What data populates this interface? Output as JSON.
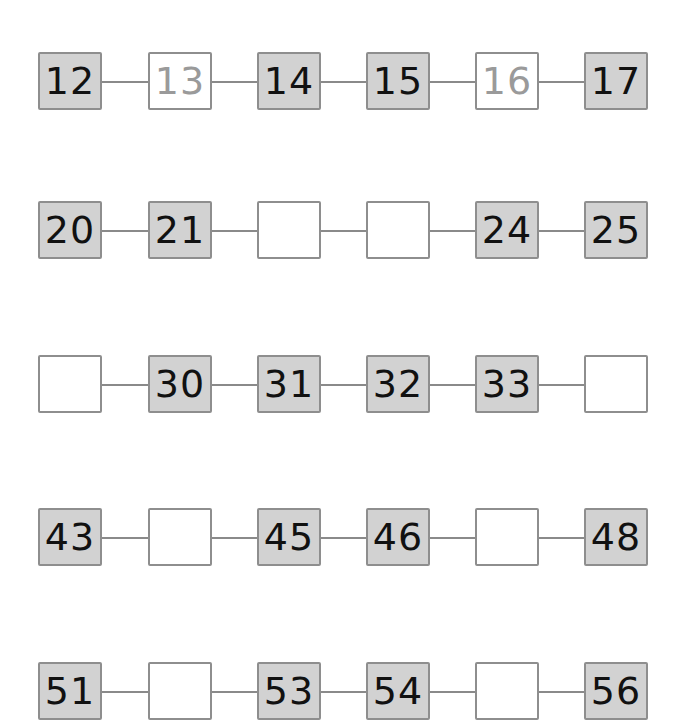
{
  "worksheet": {
    "rows": [
      {
        "cells": [
          {
            "value": "12",
            "state": "given"
          },
          {
            "value": "13",
            "state": "hint"
          },
          {
            "value": "14",
            "state": "given"
          },
          {
            "value": "15",
            "state": "given"
          },
          {
            "value": "16",
            "state": "hint"
          },
          {
            "value": "17",
            "state": "given"
          }
        ]
      },
      {
        "cells": [
          {
            "value": "20",
            "state": "given"
          },
          {
            "value": "21",
            "state": "given"
          },
          {
            "value": "",
            "state": "blank"
          },
          {
            "value": "",
            "state": "blank"
          },
          {
            "value": "24",
            "state": "given"
          },
          {
            "value": "25",
            "state": "given"
          }
        ]
      },
      {
        "cells": [
          {
            "value": "",
            "state": "blank"
          },
          {
            "value": "30",
            "state": "given"
          },
          {
            "value": "31",
            "state": "given"
          },
          {
            "value": "32",
            "state": "given"
          },
          {
            "value": "33",
            "state": "given"
          },
          {
            "value": "",
            "state": "blank"
          }
        ]
      },
      {
        "cells": [
          {
            "value": "43",
            "state": "given"
          },
          {
            "value": "",
            "state": "blank"
          },
          {
            "value": "45",
            "state": "given"
          },
          {
            "value": "46",
            "state": "given"
          },
          {
            "value": "",
            "state": "blank"
          },
          {
            "value": "48",
            "state": "given"
          }
        ]
      },
      {
        "cells": [
          {
            "value": "51",
            "state": "given"
          },
          {
            "value": "",
            "state": "blank"
          },
          {
            "value": "53",
            "state": "given"
          },
          {
            "value": "54",
            "state": "given"
          },
          {
            "value": "",
            "state": "blank"
          },
          {
            "value": "56",
            "state": "given"
          }
        ]
      }
    ]
  },
  "colors": {
    "given_fill": "#d2d2d2",
    "blank_fill": "#ffffff",
    "border": "#8e8e8e",
    "hint_text": "#9a9a9a",
    "text": "#111111"
  }
}
